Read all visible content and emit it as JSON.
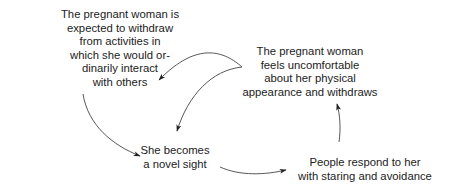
{
  "diagram": {
    "type": "cycle-flow",
    "nodes": [
      {
        "id": "expected-withdraw",
        "lines": [
          "The pregnant woman is",
          "expected to withdraw",
          "from activities in",
          "which she would or-",
          "dinarily interact",
          "with others"
        ]
      },
      {
        "id": "feels-uncomfortable",
        "lines": [
          "The pregnant woman",
          "feels uncomfortable",
          "about her physical",
          "appearance and withdraws"
        ]
      },
      {
        "id": "novel-sight",
        "lines": [
          "She becomes",
          "a novel sight"
        ]
      },
      {
        "id": "people-respond",
        "lines": [
          "People respond to her",
          "with staring and avoidance"
        ]
      }
    ],
    "edges": [
      {
        "from": "feels-uncomfortable",
        "to": "expected-withdraw"
      },
      {
        "from": "feels-uncomfortable",
        "to": "novel-sight"
      },
      {
        "from": "expected-withdraw",
        "to": "novel-sight"
      },
      {
        "from": "novel-sight",
        "to": "people-respond"
      },
      {
        "from": "people-respond",
        "to": "feels-uncomfortable"
      }
    ],
    "colors": {
      "text": "#222222",
      "line": "#333333",
      "background": "#ffffff"
    }
  }
}
